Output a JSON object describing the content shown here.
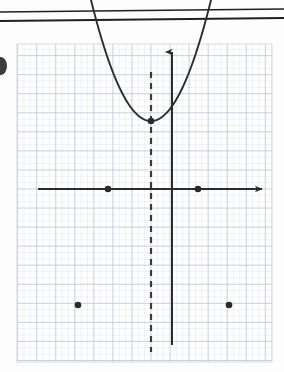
{
  "figure": {
    "kind": "coordinate-graph",
    "background_color": "#fdfdfd",
    "ink_color": "#2b2b2b",
    "grid_minor_color": "#dfe5ec",
    "grid_major_color": "#b9c4d0",
    "paper_edge_color": "#cfd6de"
  },
  "header_rules": {
    "name": "double-horizontal-rule",
    "color": "#1f1f1f",
    "lines": [
      {
        "x1": 0,
        "y1": 12,
        "x2": 284,
        "y2": 9,
        "width": 1.6
      },
      {
        "x1": 0,
        "y1": 21,
        "x2": 284,
        "y2": 18,
        "width": 1.8
      }
    ]
  },
  "edge_mark": {
    "name": "clipped-edge-mark",
    "description": "dark mark clipped by the left edge of the page",
    "cx": 1,
    "cy": 66,
    "rx": 6,
    "ry": 9,
    "color": "#2b2b2b"
  },
  "grid": {
    "left": 17,
    "top": 44,
    "right": 272,
    "bottom": 362,
    "minor_step": 6.35,
    "major_every": 3
  },
  "axes": {
    "x_axis": {
      "name": "x-axis",
      "y": 189,
      "x_start": 38,
      "x_end": 262,
      "arrow": "right",
      "stroke": 2.0
    },
    "y_axis": {
      "name": "y-axis",
      "x": 172,
      "y_start": 345,
      "y_end": 52,
      "arrow": "up",
      "stroke": 2.0
    }
  },
  "axis_of_symmetry": {
    "name": "axis-of-symmetry",
    "x": 151,
    "y_top": 72,
    "y_bottom": 352,
    "style": "dashed",
    "dash_pattern": "6 5",
    "stroke": 2.2,
    "color": "#3a3a3a"
  },
  "chart_data": {
    "type": "line",
    "title": "Downward parabola with marked vertex, roots and symmetric points",
    "xlabel": "x",
    "ylabel": "y",
    "grid": true,
    "legend": "none",
    "orientation": "opens-downward",
    "curve_stroke": 1.9,
    "curve_color": "#2b2b2b",
    "pixel_vertex": {
      "x": 151,
      "y": 121
    },
    "pixel_leading_coefficient": -0.0336,
    "curve_pixel_x_range": [
      70,
      236
    ],
    "points": [
      {
        "name": "vertex",
        "x": 151,
        "y": 121,
        "r": 3.3,
        "label": ""
      },
      {
        "name": "left-root",
        "x": 108,
        "y": 189,
        "r": 3.3,
        "label": ""
      },
      {
        "name": "right-root",
        "x": 198,
        "y": 189,
        "r": 3.3,
        "label": ""
      },
      {
        "name": "left-lower-point",
        "x": 78,
        "y": 305,
        "r": 3.3,
        "label": ""
      },
      {
        "name": "right-lower-point",
        "x": 229,
        "y": 305,
        "r": 3.3,
        "label": ""
      }
    ],
    "graph_units": {
      "origin_px": {
        "x": 172,
        "y": 189
      },
      "unit_px": 19.05,
      "vertex": {
        "x": -1.1,
        "y": 3.6
      },
      "roots": [
        -3.36,
        1.37
      ],
      "symmetric_points": [
        {
          "x": -4.93,
          "y": -6.09
        },
        {
          "x": 2.99,
          "y": -6.09
        }
      ]
    },
    "axis_of_symmetry_equation_px": 151
  }
}
